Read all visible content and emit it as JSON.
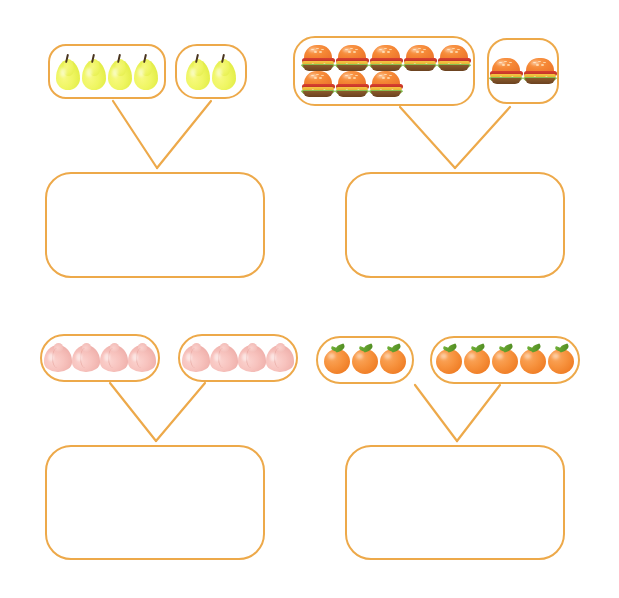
{
  "worksheet": {
    "type": "addition-with-pictures",
    "background_color": "#ffffff",
    "accent_color": "#eda94a",
    "width": 619,
    "height": 598,
    "problems": [
      {
        "id": "problem-1",
        "item_name": "pear",
        "item_icon": "pear-icon",
        "addends": [
          4,
          2
        ],
        "sum": 6,
        "answer_value": "",
        "answer_placeholder": "",
        "groups": [
          {
            "count": 4,
            "rows": [
              4
            ],
            "x": 48,
            "y": 44,
            "width": 118,
            "height": 55,
            "radius": 18
          },
          {
            "count": 2,
            "rows": [
              2
            ],
            "x": 175,
            "y": 44,
            "width": 72,
            "height": 55,
            "radius": 22
          }
        ],
        "answer_box": {
          "x": 45,
          "y": 172,
          "width": 220,
          "height": 106,
          "radius": 26
        },
        "connector": {
          "left_x": 113,
          "right_x": 211,
          "top_y": 101,
          "apex_x": 157,
          "apex_y": 168
        }
      },
      {
        "id": "problem-2",
        "item_name": "hamburger",
        "item_icon": "burger-icon",
        "addends": [
          8,
          2
        ],
        "sum": 10,
        "answer_value": "",
        "answer_placeholder": "",
        "groups": [
          {
            "count": 8,
            "rows": [
              5,
              3
            ],
            "x": 293,
            "y": 36,
            "width": 182,
            "height": 70,
            "radius": 22
          },
          {
            "count": 2,
            "rows": [
              2
            ],
            "x": 487,
            "y": 38,
            "width": 72,
            "height": 66,
            "radius": 20
          }
        ],
        "answer_box": {
          "x": 345,
          "y": 172,
          "width": 220,
          "height": 106,
          "radius": 26
        },
        "connector": {
          "left_x": 400,
          "right_x": 510,
          "top_y": 107,
          "apex_x": 455,
          "apex_y": 168
        }
      },
      {
        "id": "problem-3",
        "item_name": "peach",
        "item_icon": "peach-icon",
        "addends": [
          4,
          4
        ],
        "sum": 8,
        "answer_value": "",
        "answer_placeholder": "",
        "groups": [
          {
            "count": 4,
            "rows": [
              4
            ],
            "x": 40,
            "y": 334,
            "width": 120,
            "height": 48,
            "radius": 24
          },
          {
            "count": 4,
            "rows": [
              4
            ],
            "x": 178,
            "y": 334,
            "width": 120,
            "height": 48,
            "radius": 24
          }
        ],
        "answer_box": {
          "x": 45,
          "y": 445,
          "width": 220,
          "height": 115,
          "radius": 26
        },
        "connector": {
          "left_x": 110,
          "right_x": 205,
          "top_y": 383,
          "apex_x": 156,
          "apex_y": 441
        }
      },
      {
        "id": "problem-4",
        "item_name": "orange",
        "item_icon": "orange-icon",
        "addends": [
          3,
          5
        ],
        "sum": 8,
        "answer_value": "",
        "answer_placeholder": "",
        "groups": [
          {
            "count": 3,
            "rows": [
              3
            ],
            "x": 316,
            "y": 336,
            "width": 98,
            "height": 48,
            "radius": 24
          },
          {
            "count": 5,
            "rows": [
              5
            ],
            "x": 430,
            "y": 336,
            "width": 150,
            "height": 48,
            "radius": 24
          }
        ],
        "answer_box": {
          "x": 345,
          "y": 445,
          "width": 220,
          "height": 115,
          "radius": 26
        },
        "connector": {
          "left_x": 415,
          "right_x": 500,
          "top_y": 385,
          "apex_x": 457,
          "apex_y": 441
        }
      }
    ]
  }
}
